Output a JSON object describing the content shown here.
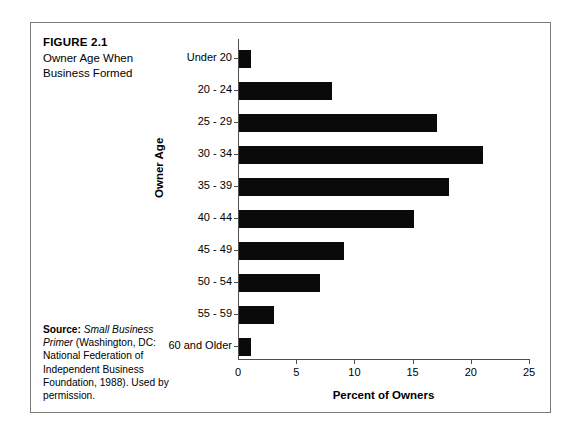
{
  "figure": {
    "number": "FIGURE 2.1",
    "title_line1": "Owner Age When",
    "title_line2": "Business Formed"
  },
  "source": {
    "label": "Source:",
    "italic_part": "Small Business Primer",
    "rest": "(Washington, DC: National Federation of Independent Business Foundation, 1988). Used by permission."
  },
  "chart_data": {
    "type": "bar",
    "orientation": "horizontal",
    "title": "Owner Age When Business Formed",
    "xlabel": "Percent of Owners",
    "ylabel": "Owner Age",
    "categories": [
      "Under 20",
      "20 - 24",
      "25 - 29",
      "30 - 34",
      "35 - 39",
      "40 - 44",
      "45 - 49",
      "50 - 54",
      "55 - 59",
      "60 and Older"
    ],
    "values": [
      1,
      8,
      17,
      21,
      18,
      15,
      9,
      7,
      3,
      1
    ],
    "xlim": [
      0,
      25
    ],
    "xticks": [
      0,
      5,
      10,
      15,
      20,
      25
    ],
    "xtick_labels": [
      "0",
      "5",
      "10",
      "15",
      "20",
      "25"
    ],
    "grid": false,
    "legend": false,
    "bar_color": "#0a0a0a"
  }
}
